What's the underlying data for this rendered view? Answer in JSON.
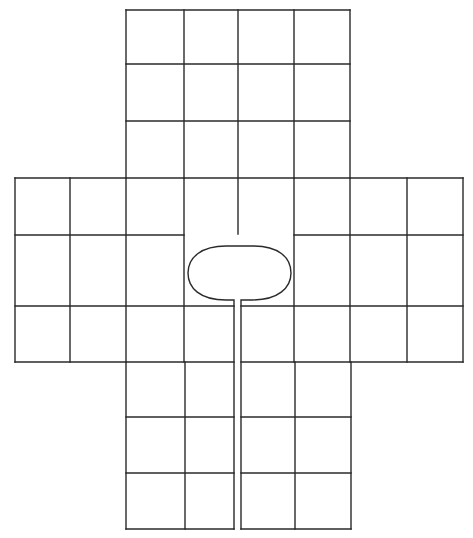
{
  "board": {
    "title": "Cross-shaped game board",
    "line_color": "#2a2a2a",
    "background": "#ffffff",
    "layout": "cross",
    "arms": {
      "top": {
        "cols": 4,
        "rows": 3
      },
      "left": {
        "cols": 2,
        "rows": 3
      },
      "right": {
        "cols": 2,
        "rows": 3
      },
      "center": {
        "cols": 4,
        "rows": 3
      },
      "bottom": {
        "cols": 4,
        "rows": 3
      }
    },
    "center_feature": {
      "shape": "oval-with-stem",
      "description": "Oval home space with a narrow channel running down to the bottom edge"
    }
  }
}
